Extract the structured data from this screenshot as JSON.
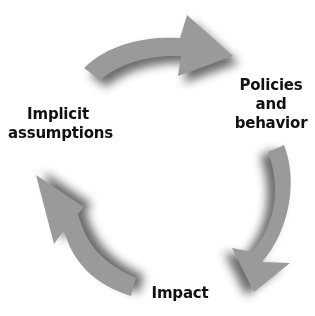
{
  "diagram": {
    "type": "cycle",
    "arrow_color": "#9a9a9a",
    "shadow_color": "#3a3a3a",
    "nodes": [
      {
        "id": "policies",
        "lines": [
          "Policies",
          "and",
          "behavior"
        ]
      },
      {
        "id": "impact",
        "lines": [
          "Impact"
        ]
      },
      {
        "id": "implicit",
        "lines": [
          "Implicit",
          "assumptions"
        ]
      }
    ],
    "edges": [
      {
        "from": "implicit",
        "to": "policies",
        "direction": "clockwise"
      },
      {
        "from": "policies",
        "to": "impact",
        "direction": "clockwise"
      },
      {
        "from": "impact",
        "to": "implicit",
        "direction": "clockwise"
      }
    ]
  }
}
